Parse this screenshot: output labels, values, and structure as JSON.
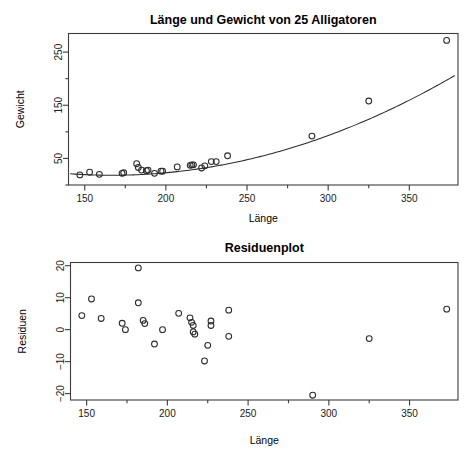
{
  "chart_data": [
    {
      "type": "scatter",
      "id": "scatter-fit",
      "title": "Länge und Gewicht von 25 Alligatoren",
      "xlabel": "Länge",
      "ylabel": "Gewicht",
      "xlim": [
        140,
        380
      ],
      "ylim": [
        0,
        285
      ],
      "xticks": [
        150,
        200,
        250,
        300,
        350
      ],
      "xminorticks": [
        175,
        225,
        275,
        325
      ],
      "yticks": [
        50,
        150,
        250
      ],
      "yminorticks": [
        0,
        100,
        200
      ],
      "grid": false,
      "legend": null,
      "npoints": 25,
      "points": [
        {
          "x": 147,
          "y": 19
        },
        {
          "x": 153,
          "y": 24
        },
        {
          "x": 159,
          "y": 20
        },
        {
          "x": 173,
          "y": 22
        },
        {
          "x": 174,
          "y": 23
        },
        {
          "x": 182,
          "y": 40
        },
        {
          "x": 183,
          "y": 33
        },
        {
          "x": 185,
          "y": 28
        },
        {
          "x": 188,
          "y": 27
        },
        {
          "x": 189,
          "y": 28
        },
        {
          "x": 193,
          "y": 22
        },
        {
          "x": 197,
          "y": 26
        },
        {
          "x": 198,
          "y": 26
        },
        {
          "x": 207,
          "y": 34
        },
        {
          "x": 215,
          "y": 37
        },
        {
          "x": 216,
          "y": 38
        },
        {
          "x": 217,
          "y": 38
        },
        {
          "x": 222,
          "y": 32
        },
        {
          "x": 224,
          "y": 36
        },
        {
          "x": 228,
          "y": 44
        },
        {
          "x": 231,
          "y": 44
        },
        {
          "x": 238,
          "y": 55
        },
        {
          "x": 290,
          "y": 92
        },
        {
          "x": 325,
          "y": 158
        },
        {
          "x": 373,
          "y": 272
        }
      ],
      "fit_curve": {
        "description": "exponential/quadratic regression curve",
        "from_x": 141,
        "to_x": 378
      }
    },
    {
      "type": "scatter",
      "id": "residual-plot",
      "title": "Residuenplot",
      "xlabel": "Länge",
      "ylabel": "Residuen",
      "xlim": [
        140,
        380
      ],
      "ylim": [
        -22,
        21
      ],
      "xticks": [
        150,
        200,
        250,
        300,
        350
      ],
      "xminorticks": [
        175,
        225,
        275,
        325
      ],
      "yticks": [
        20,
        10,
        0,
        -10,
        -20
      ],
      "grid": false,
      "legend": null,
      "npoints": 25,
      "points": [
        {
          "x": 147,
          "y": 4.4
        },
        {
          "x": 153,
          "y": 9.6
        },
        {
          "x": 159,
          "y": 3.5
        },
        {
          "x": 172,
          "y": 2.0
        },
        {
          "x": 174,
          "y": 0.0
        },
        {
          "x": 182,
          "y": 19.3
        },
        {
          "x": 182,
          "y": 8.4
        },
        {
          "x": 185,
          "y": 2.9
        },
        {
          "x": 186,
          "y": 1.9
        },
        {
          "x": 192,
          "y": -4.5
        },
        {
          "x": 197,
          "y": 0.0
        },
        {
          "x": 207,
          "y": 5.1
        },
        {
          "x": 214,
          "y": 3.7
        },
        {
          "x": 215,
          "y": 2.3
        },
        {
          "x": 216,
          "y": 1.3
        },
        {
          "x": 216,
          "y": -0.7
        },
        {
          "x": 217,
          "y": -1.4
        },
        {
          "x": 223,
          "y": -9.8
        },
        {
          "x": 225,
          "y": -4.9
        },
        {
          "x": 227,
          "y": 2.7
        },
        {
          "x": 227,
          "y": 1.3
        },
        {
          "x": 238,
          "y": 6.1
        },
        {
          "x": 238,
          "y": -2.1
        },
        {
          "x": 290,
          "y": -20.5
        },
        {
          "x": 325,
          "y": -2.8
        },
        {
          "x": 373,
          "y": 6.4
        }
      ]
    }
  ],
  "figure": {
    "background_color": "#ffffff",
    "foreground_color": "#2b2b2b",
    "marker": "open-circle"
  }
}
